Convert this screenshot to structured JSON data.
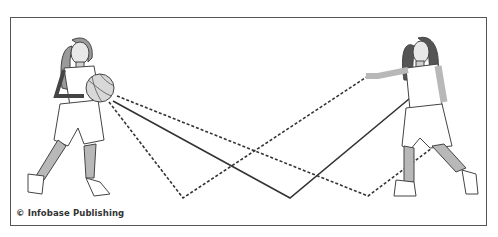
{
  "diagram": {
    "credit": "© Infobase Publishing",
    "players": [
      {
        "id": "left-player",
        "role": "passer",
        "holding": "basketball"
      },
      {
        "id": "right-player",
        "role": "receiver"
      }
    ],
    "pass_paths": [
      {
        "style": "dashed",
        "from": "ball",
        "bounce_point": "left-floor",
        "to": "receiver-hand"
      },
      {
        "style": "solid",
        "from": "ball",
        "bounce_point": "center-floor",
        "to": "receiver-waist"
      },
      {
        "style": "dashed",
        "from": "ball",
        "bounce_point": "right-floor",
        "to": "receiver-knee"
      }
    ],
    "colors": {
      "line": "#333333",
      "skin": "#b8b8b8",
      "outline": "#444444",
      "frame": "#555555"
    }
  }
}
